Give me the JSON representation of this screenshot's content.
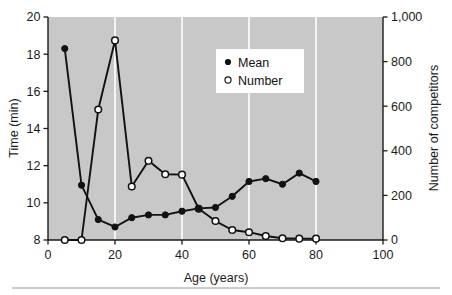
{
  "chart_data": {
    "type": "line",
    "title": "",
    "xlabel": "Age (years)",
    "ylabel": "Time (min)",
    "y2label": "Number of competitors",
    "xlim": [
      0,
      100
    ],
    "ylim": [
      8,
      20
    ],
    "y2lim": [
      0,
      1000
    ],
    "xticks": [
      0,
      20,
      40,
      60,
      80,
      100
    ],
    "xticklabels": [
      "0",
      "20",
      "40",
      "60",
      "80",
      "100"
    ],
    "yticks": [
      8,
      10,
      12,
      14,
      16,
      18,
      20
    ],
    "yticklabels": [
      "8",
      "10",
      "12",
      "14",
      "16",
      "18",
      "20"
    ],
    "y2ticks": [
      0,
      200,
      400,
      600,
      800,
      1000
    ],
    "y2ticklabels": [
      "0",
      "200",
      "400",
      "600",
      "800",
      "1,000"
    ],
    "grid": "vertical-white-at-xticks",
    "plot_background": "#c8c8c8",
    "legend_position": "upper-center-right",
    "series": [
      {
        "name": "Mean",
        "axis": "left",
        "marker": "filled-circle",
        "color": "#111111",
        "x": [
          5,
          10,
          15,
          20,
          25,
          30,
          35,
          40,
          45,
          50,
          55,
          60,
          65,
          70,
          75,
          80
        ],
        "values": [
          18.3,
          10.95,
          9.1,
          8.7,
          9.2,
          9.35,
          9.35,
          9.55,
          9.7,
          9.75,
          10.35,
          11.15,
          11.3,
          11.0,
          11.6,
          11.15
        ]
      },
      {
        "name": "Number",
        "axis": "right",
        "marker": "open-circle",
        "color": "#111111",
        "x": [
          5,
          10,
          15,
          20,
          25,
          30,
          35,
          40,
          45,
          50,
          55,
          60,
          65,
          70,
          75,
          80
        ],
        "values": [
          0,
          0,
          585,
          895,
          240,
          355,
          295,
          293,
          140,
          85,
          45,
          35,
          18,
          8,
          6,
          6
        ]
      }
    ],
    "legend_entries": [
      {
        "label": "Mean",
        "marker": "filled-circle"
      },
      {
        "label": "Number",
        "marker": "open-circle"
      }
    ]
  },
  "axes": {
    "x_title": "Age (years)",
    "y_left_title": "Time (min)",
    "y_right_title": "Number of competitors"
  },
  "x_tick_labels": [
    "0",
    "20",
    "40",
    "60",
    "80",
    "100"
  ],
  "y_left_tick_labels": [
    "20",
    "18",
    "16",
    "14",
    "12",
    "10",
    "8"
  ],
  "y_right_tick_labels": [
    "1,000",
    "800",
    "600",
    "400",
    "200",
    "0"
  ],
  "legend": {
    "mean_label": "Mean",
    "number_label": "Number"
  },
  "colors": {
    "plot_bg": "#c8c8c8",
    "line": "#111111",
    "gridline": "#ffffff",
    "text": "#1a1a1a",
    "page_bg": "#ffffff",
    "rule": "#999999"
  }
}
